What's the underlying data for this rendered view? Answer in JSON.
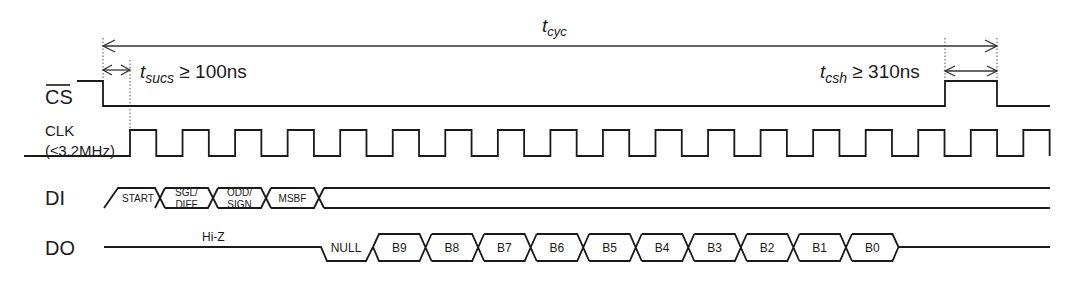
{
  "diagram": {
    "annotations": {
      "t_cyc": {
        "main": "t",
        "sub": "cyc"
      },
      "t_sucs": {
        "main": "t",
        "sub": "sucs",
        "rest": " ≥ 100ns"
      },
      "t_csh": {
        "main": "t",
        "sub": "csh",
        "rest": " ≥ 310ns"
      }
    },
    "signals": {
      "cs": {
        "label": "CS",
        "overbar": true
      },
      "clk": {
        "label_line1": "CLK",
        "label_line2": "(≤3.2MHz)",
        "pulses": 18
      },
      "di": {
        "label": "DI",
        "cells": [
          {
            "line1": "START",
            "line2": ""
          },
          {
            "line1": "SGL/",
            "line2": "DIFF"
          },
          {
            "line1": "ODD/",
            "line2": "SIGN"
          },
          {
            "line1": "MSBF",
            "line2": ""
          }
        ]
      },
      "do": {
        "label": "DO",
        "hiz_label": "Hi-Z",
        "null_label": "NULL",
        "bits": [
          "B9",
          "B8",
          "B7",
          "B6",
          "B5",
          "B4",
          "B3",
          "B2",
          "B1",
          "B0"
        ]
      }
    }
  }
}
